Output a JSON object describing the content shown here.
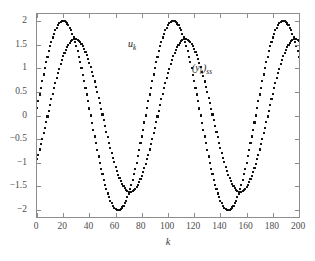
{
  "chart_data": {
    "type": "scatter",
    "title": "",
    "xlabel": "k",
    "ylabel": "",
    "xlim": [
      0,
      200
    ],
    "ylim": [
      -2.15,
      2.15
    ],
    "xticks": [
      0,
      20,
      40,
      60,
      80,
      100,
      120,
      140,
      160,
      180,
      200
    ],
    "xticklabels": [
      "0",
      "20",
      "40",
      "60",
      "80",
      "100",
      "120",
      "140",
      "160",
      "180",
      "200"
    ],
    "yticks": [
      2,
      1.5,
      1,
      0.5,
      0,
      -0.5,
      -1,
      -1.5,
      -2
    ],
    "yticklabels": [
      "2",
      "1.5",
      "1",
      "0.5",
      "0",
      "-0.5",
      "-1",
      "-1.5",
      "-2"
    ],
    "grid": false,
    "legend_position": "inline-annotations",
    "marker": "square-dot",
    "marker_color": "#111111",
    "axis_color": "#8c8c8c",
    "background": "#ffffff",
    "series": [
      {
        "name": "u_k",
        "label": "u",
        "label_sub": "k",
        "annotation_text": "u",
        "amplitude": 2.0,
        "period": 84,
        "phase_deg": 4.3,
        "offset": 0,
        "peaks_at": [
          20,
          104,
          188
        ],
        "troughs_at": [
          62,
          146
        ],
        "start_value": 0.15,
        "end_value": 1.28,
        "npoints": 201
      },
      {
        "name": "(y_k)_ss",
        "label": "(y",
        "label_sub": "k",
        "label_tail": ")",
        "label_tail_sub": "ss",
        "annotation_text": "(y",
        "amplitude": 1.62,
        "period": 84,
        "phase_deg": -35.0,
        "offset": 0,
        "peaks_at": [
          29,
          113,
          197
        ],
        "troughs_at": [
          71,
          155
        ],
        "start_value": -0.93,
        "end_value": 1.6,
        "npoints": 201
      }
    ]
  },
  "annotations": {
    "u_main": "u",
    "u_sub": "k",
    "y_open": "(y",
    "y_sub": "k",
    "y_close": ")",
    "y_ss": "ss"
  },
  "axis": {
    "xlabel": "k"
  }
}
